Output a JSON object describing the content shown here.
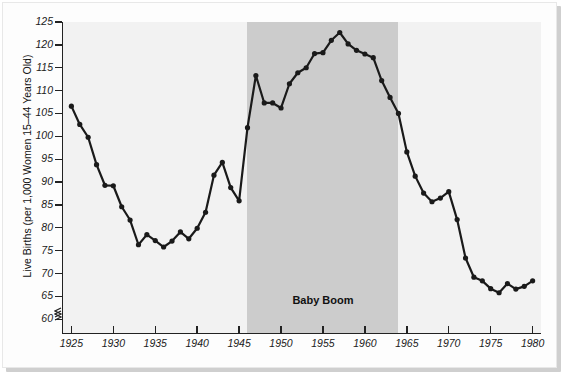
{
  "chart_data": {
    "type": "line",
    "title": "",
    "subtitle": "",
    "xlabel": "",
    "ylabel": "Live Births (per 1,000 Women 15–44 Years Old)",
    "xlim": [
      1924,
      1981
    ],
    "ylim": [
      57,
      125
    ],
    "y_axis_break": true,
    "y_break_symbol": "≈",
    "grid": false,
    "legend": "none",
    "x_ticks": [
      1925,
      1930,
      1935,
      1940,
      1945,
      1950,
      1955,
      1960,
      1965,
      1970,
      1975,
      1980
    ],
    "x_tick_labels": [
      "1925",
      "1930",
      "1935",
      "1940",
      "1945",
      "1950",
      "1955",
      "1960",
      "1965",
      "1970",
      "1975",
      "1980"
    ],
    "y_ticks": [
      60,
      65,
      70,
      75,
      80,
      85,
      90,
      95,
      100,
      105,
      110,
      115,
      120,
      125
    ],
    "y_tick_labels": [
      "60",
      "65",
      "70",
      "75",
      "80",
      "85",
      "90",
      "95",
      "100",
      "105",
      "110",
      "115",
      "120",
      "125"
    ],
    "series": [
      {
        "name": "Live Births per 1,000 Women 15–44",
        "marker": "dot",
        "color": "#1a1a1a",
        "x": [
          1925,
          1926,
          1927,
          1928,
          1929,
          1930,
          1931,
          1932,
          1933,
          1934,
          1935,
          1936,
          1937,
          1938,
          1939,
          1940,
          1941,
          1942,
          1943,
          1944,
          1945,
          1946,
          1947,
          1948,
          1949,
          1950,
          1951,
          1952,
          1953,
          1954,
          1955,
          1956,
          1957,
          1958,
          1959,
          1960,
          1961,
          1962,
          1963,
          1964,
          1965,
          1966,
          1967,
          1968,
          1969,
          1970,
          1971,
          1972,
          1973,
          1974,
          1975,
          1976,
          1977,
          1978,
          1979,
          1980
        ],
        "y": [
          106.6,
          102.6,
          99.8,
          93.8,
          89.3,
          89.2,
          84.6,
          81.7,
          76.3,
          78.5,
          77.2,
          75.8,
          77.1,
          79.1,
          77.6,
          79.9,
          83.4,
          91.5,
          94.3,
          88.8,
          85.9,
          101.9,
          113.3,
          107.3,
          107.3,
          106.2,
          111.5,
          113.9,
          115.0,
          118.1,
          118.3,
          121.0,
          122.7,
          120.2,
          118.8,
          118.0,
          117.2,
          112.2,
          108.5,
          105.0,
          96.6,
          91.3,
          87.6,
          85.7,
          86.5,
          87.9,
          81.8,
          73.4,
          69.2,
          68.4,
          66.7,
          65.8,
          67.8,
          66.6,
          67.2,
          68.4
        ],
        "annotations": [
          {
            "text": "Baby Boom",
            "x_range": [
              1946,
              1964
            ],
            "y": 64,
            "style": "bold"
          }
        ]
      }
    ],
    "shaded_regions": [
      {
        "label": "Baby Boom",
        "x_start": 1946,
        "x_end": 1964,
        "color": "#cccccc"
      }
    ],
    "plot_background": "#f2f2f2",
    "line_color": "#1a1a1a",
    "line_width": 2.2,
    "marker_size": 2.6
  }
}
